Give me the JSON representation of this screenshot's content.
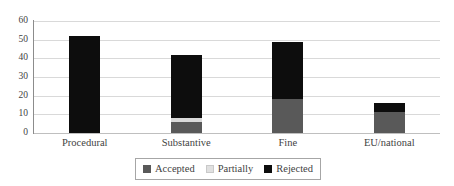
{
  "chart_data": {
    "type": "bar",
    "stacked": true,
    "title": "",
    "subtitle": "",
    "xlabel": "",
    "ylabel": "",
    "categories": [
      "Procedural",
      "Substantive",
      "Fine",
      "EU/national"
    ],
    "series": [
      {
        "name": "Accepted",
        "color": "#595959",
        "values": [
          0,
          6,
          18,
          11
        ]
      },
      {
        "name": "Partially",
        "color": "#d9d9d9",
        "values": [
          0,
          2,
          0,
          0
        ]
      },
      {
        "name": "Rejected",
        "color": "#0d0d0d",
        "values": [
          52,
          34,
          31,
          5
        ]
      }
    ],
    "totals": [
      52,
      42,
      49,
      16
    ],
    "ylim": [
      0,
      60
    ],
    "yticks": [
      0,
      10,
      20,
      30,
      40,
      50,
      60
    ],
    "ytick_labels": [
      "0",
      "10",
      "20",
      "30",
      "40",
      "50",
      "60"
    ],
    "grid": "horizontal",
    "legend_position": "bottom-center",
    "legend_boxed": true
  },
  "colors": {
    "accepted": "#595959",
    "partially": "#d9d9d9",
    "rejected": "#0d0d0d",
    "gridline": "#d9d9d9",
    "axis": "#8c8c8c",
    "text": "#3f3f3f",
    "background": "#ffffff"
  }
}
